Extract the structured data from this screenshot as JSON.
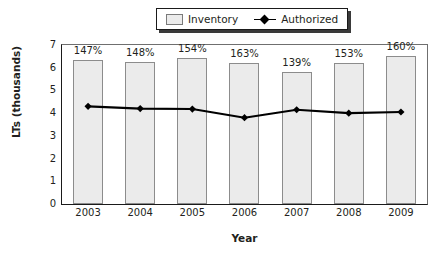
{
  "legend": {
    "position": "top-center",
    "entries": [
      {
        "label": "Inventory",
        "marker": "bar-swatch-icon",
        "color": "#ebebeb"
      },
      {
        "label": "Authorized",
        "marker": "line-diamond-icon",
        "color": "#000000"
      }
    ]
  },
  "axes": {
    "y_title": "LTs (thousands)",
    "x_title": "Year",
    "y_ticks": [
      "7",
      "6",
      "5",
      "4",
      "3",
      "2",
      "1",
      "0"
    ]
  },
  "chart_data": {
    "type": "bar",
    "title": "",
    "subtitle": "",
    "xlabel": "Year",
    "ylabel": "LTs (thousands)",
    "ylim": [
      0,
      7
    ],
    "grid": false,
    "legend_position": "top-center",
    "categories": [
      "2003",
      "2004",
      "2005",
      "2006",
      "2007",
      "2008",
      "2009"
    ],
    "series": [
      {
        "name": "Inventory",
        "type": "bar",
        "color": "#ebebeb",
        "values": [
          6.35,
          6.25,
          6.45,
          6.2,
          5.8,
          6.2,
          6.5
        ]
      },
      {
        "name": "Authorized",
        "type": "line",
        "color": "#000000",
        "values": [
          4.3,
          4.2,
          4.18,
          3.8,
          4.15,
          4.0,
          4.05
        ]
      }
    ],
    "annotations": {
      "bar_labels": [
        "147%",
        "148%",
        "154%",
        "163%",
        "139%",
        "153%",
        "160%"
      ]
    }
  }
}
